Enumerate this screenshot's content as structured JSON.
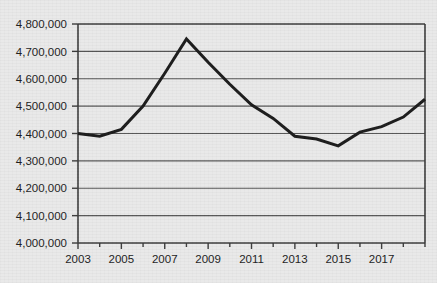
{
  "chart_data": {
    "type": "line",
    "title": "",
    "xlabel": "",
    "ylabel": "",
    "x": [
      2003,
      2004,
      2005,
      2006,
      2007,
      2008,
      2009,
      2010,
      2011,
      2012,
      2013,
      2014,
      2015,
      2016,
      2017,
      2018,
      2019
    ],
    "values": [
      4400000,
      4390000,
      4415000,
      4500000,
      4620000,
      4745000,
      4660000,
      4580000,
      4505000,
      4455000,
      4390000,
      4380000,
      4355000,
      4405000,
      4425000,
      4460000,
      4525000
    ],
    "series": [
      {
        "name": "value",
        "values": [
          4400000,
          4390000,
          4415000,
          4500000,
          4620000,
          4745000,
          4660000,
          4580000,
          4505000,
          4455000,
          4390000,
          4380000,
          4355000,
          4405000,
          4425000,
          4460000,
          4525000
        ]
      }
    ],
    "ylim": [
      4000000,
      4800000
    ],
    "xlim": [
      2003,
      2019
    ],
    "ytick_values": [
      4000000,
      4100000,
      4200000,
      4300000,
      4400000,
      4500000,
      4600000,
      4700000,
      4800000
    ],
    "ytick_labels": [
      "4,000,000",
      "4,100,000",
      "4,200,000",
      "4,300,000",
      "4,400,000",
      "4,500,000",
      "4,600,000",
      "4,700,000",
      "4,800,000"
    ],
    "xtick_values": [
      2003,
      2004,
      2005,
      2006,
      2007,
      2008,
      2009,
      2010,
      2011,
      2012,
      2013,
      2014,
      2015,
      2016,
      2017,
      2018,
      2019
    ],
    "xtick_labels": [
      "2003",
      "",
      "2005",
      "",
      "2007",
      "",
      "2009",
      "",
      "2011",
      "",
      "2013",
      "",
      "2015",
      "",
      "2017",
      "",
      ""
    ],
    "grid": true,
    "grid_axis": "y",
    "legend": false,
    "legend_position": "none",
    "line_color": "#1a1a1a",
    "line_width": 3,
    "plot_background": "#e9e9e9",
    "axis_color": "#4a4a4a",
    "grid_color": "#555555"
  },
  "page": {
    "background_color": "#e9e9e9",
    "cropped_title": ""
  }
}
